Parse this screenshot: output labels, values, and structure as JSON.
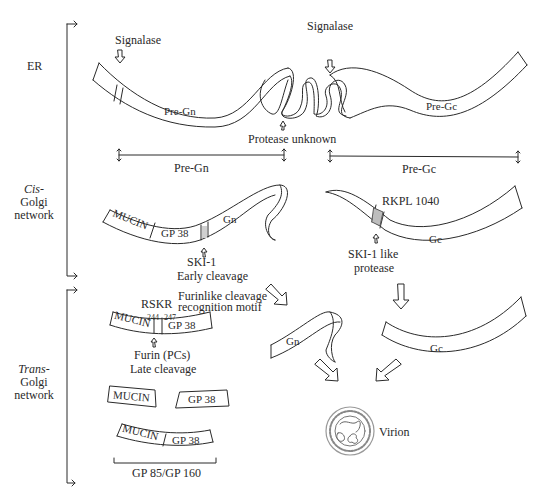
{
  "compartments": {
    "er": "ER",
    "cis_italic": "Cis",
    "cis_rest": "-",
    "cis_line2": "Golgi",
    "cis_line3": "network",
    "trans_italic": "Trans",
    "trans_rest": "-",
    "trans_line2": "Golgi",
    "trans_line3": "network"
  },
  "er_stage": {
    "signalase_left": "Signalase",
    "signalase_right": "Signalase",
    "pre_gn": "Pre-Gn",
    "pre_gc": "Pre-Gc",
    "protease": "Protease unknown"
  },
  "spans": {
    "pre_gn": "Pre-Gn",
    "pre_gc": "Pre-Gc"
  },
  "cis_stage": {
    "mucin": "MUCIN",
    "gp38": "GP 38",
    "gn": "Gn",
    "ski1": "SKI-1",
    "early": "Early cleavage",
    "rkpl": "RKPL 1040",
    "gc": "Gc",
    "ski1_like_1": "SKI-1 like",
    "ski1_like_2": "protease"
  },
  "trans_stage": {
    "rskr": "RSKR",
    "pos_244": "244",
    "pos_247": "247",
    "mucin": "MUCIN",
    "gp38": "GP 38",
    "furinlike_1": "Furinlike cleavage",
    "furinlike_2": "recognition motif",
    "furin_1": "Furin (PCs)",
    "furin_2": "Late cleavage",
    "mucin_sep": "MUCIN",
    "gp38_sep": "GP 38",
    "mucin_join": "MUCIN",
    "gp38_join": "GP 38",
    "gp85": "GP 85/GP 160",
    "gn": "Gn",
    "gc": "Gc",
    "virion": "Virion"
  },
  "icons": {
    "cleavage_arrow": "hollow-arrow",
    "span_marker": "double-headed-arrow",
    "virion": "virion-particle"
  }
}
